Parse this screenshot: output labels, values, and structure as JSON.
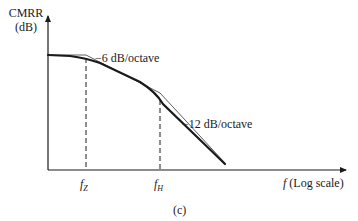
{
  "figure": {
    "y_axis_label_line1": "CMRR",
    "y_axis_label_line2": "(dB)",
    "x_axis_label_var": "f",
    "x_axis_label_rest": " (Log scale)",
    "annotation_slope1": "−6 dB/octave",
    "annotation_slope2": "−12 dB/octave",
    "tick_fz_base": "f",
    "tick_fz_sub": "Z",
    "tick_fh_base": "f",
    "tick_fh_sub": "H",
    "caption": "(c)"
  },
  "colors": {
    "ink": "#1a1a1a",
    "background": "#ffffff"
  }
}
